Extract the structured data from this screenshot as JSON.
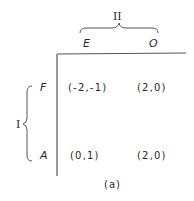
{
  "game": {
    "player_column": "II",
    "player_row": "I",
    "column_strategies": [
      "E",
      "O"
    ],
    "row_strategies": [
      "F",
      "A"
    ],
    "payoffs": [
      [
        "(-2,-1)",
        "(2,0)"
      ],
      [
        "(0,1)",
        "(2,0)"
      ]
    ],
    "caption": "(a)"
  },
  "colors": {
    "ink": "#2a2a2a",
    "line": "#555555",
    "background": "#ffffff"
  }
}
